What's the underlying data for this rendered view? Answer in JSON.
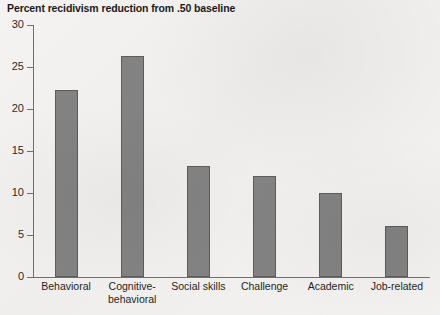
{
  "chart_data": {
    "type": "bar",
    "title": "Percent recidivism reduction from .50 baseline",
    "xlabel": "",
    "ylabel": "",
    "ylim": [
      0,
      30
    ],
    "yticks": [
      0,
      5,
      10,
      15,
      20,
      25,
      30
    ],
    "ytick_labels": [
      "0",
      "5",
      "10",
      "15",
      "20",
      "25",
      "30"
    ],
    "grid": false,
    "legend": null,
    "categories": [
      "Behavioral",
      "Cognitive-\nbehavioral",
      "Social skills",
      "Challenge",
      "Academic",
      "Job-related"
    ],
    "values": [
      22.3,
      26.3,
      13.2,
      12.0,
      10.0,
      6.1
    ],
    "bar_color": "#828282",
    "bar_border_color": "#5c5c5c",
    "axis_color": "#6f6f6f",
    "background_color": "#f2f1ef",
    "text_color": "#1f1f1f"
  }
}
